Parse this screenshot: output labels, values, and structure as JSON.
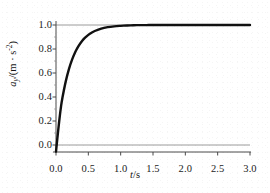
{
  "chart_data": {
    "type": "line",
    "title": "",
    "subtitle": "",
    "xlabel": "t/s",
    "ylabel": "a_y/(m · s^-2)",
    "xlabel_parts": {
      "variable": "t",
      "separator": "/",
      "unit": "s"
    },
    "ylabel_parts": {
      "variable": "a",
      "subscript": "y",
      "separator": "/(",
      "unit": "m · s",
      "exponent": "-2",
      "close": ")"
    },
    "xlim": [
      0.0,
      3.0
    ],
    "ylim": [
      -0.12,
      1.08
    ],
    "xticks": [
      0.0,
      0.5,
      1.0,
      1.5,
      2.0,
      2.5,
      3.0
    ],
    "xtick_labels": [
      "0.0",
      "0.5",
      "1.0",
      "1.5",
      "2.0",
      "2.5",
      "3.0"
    ],
    "yticks": [
      0.0,
      0.2,
      0.4,
      0.6,
      0.8,
      1.0
    ],
    "ytick_labels": [
      "0.0",
      "0.2",
      "0.4",
      "0.6",
      "0.8",
      "1.0"
    ],
    "grid": false,
    "legend": null,
    "legend_position": "none",
    "curve_color": "#111111",
    "reference_line_color": "#9a9a9a",
    "axis_color": "#4a4a4a",
    "background_color": "#ffffff",
    "reference_lines": [
      {
        "name": "asymptote",
        "orientation": "horizontal",
        "y": 1.0
      },
      {
        "name": "zero-line",
        "orientation": "horizontal",
        "y": 0.0
      }
    ],
    "series": [
      {
        "name": "a_y(t)",
        "model": "a_y = 1 - exp(-t/0.2)",
        "time_constant": 0.2,
        "asymptote": 1.0,
        "x": [
          0.0,
          0.02,
          0.05,
          0.08,
          0.1,
          0.15,
          0.2,
          0.25,
          0.3,
          0.35,
          0.4,
          0.45,
          0.5,
          0.55,
          0.6,
          0.7,
          0.8,
          0.9,
          1.0,
          1.1,
          1.2,
          1.3,
          1.4,
          1.5,
          1.75,
          2.0,
          2.25,
          2.5,
          2.75,
          3.0
        ],
        "y": [
          -0.055,
          0.05,
          0.2,
          0.33,
          0.395,
          0.528,
          0.632,
          0.713,
          0.777,
          0.826,
          0.865,
          0.895,
          0.918,
          0.936,
          0.95,
          0.97,
          0.982,
          0.989,
          0.993,
          0.996,
          0.998,
          0.999,
          0.999,
          1.0,
          1.0,
          1.0,
          1.0,
          1.0,
          1.0,
          1.0
        ]
      }
    ]
  },
  "figure": {
    "plot_area_px": {
      "left": 56,
      "right": 250,
      "top": 25,
      "bottom": 145
    }
  }
}
